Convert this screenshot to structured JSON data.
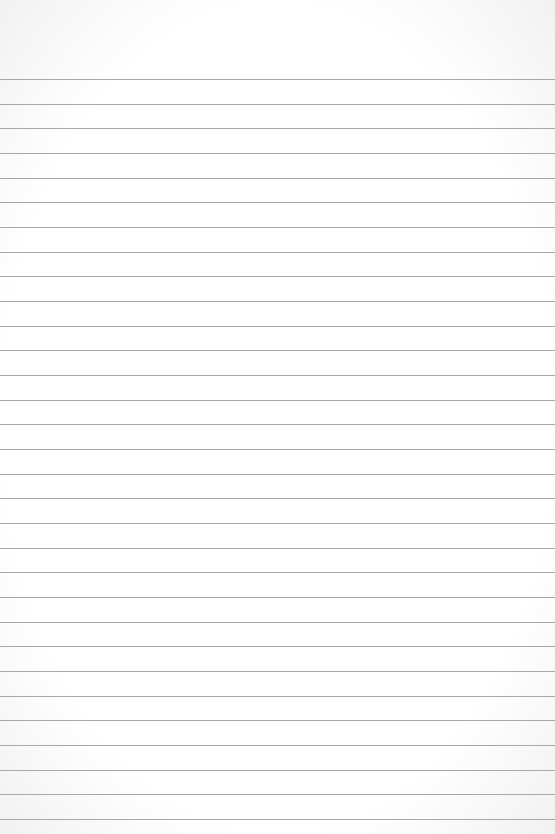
{
  "paper": {
    "type": "lined-paper",
    "background_color": "#ffffff",
    "line_color": "#a8a8a8",
    "first_line_y": 79,
    "line_spacing": 24.67,
    "line_count": 31
  }
}
